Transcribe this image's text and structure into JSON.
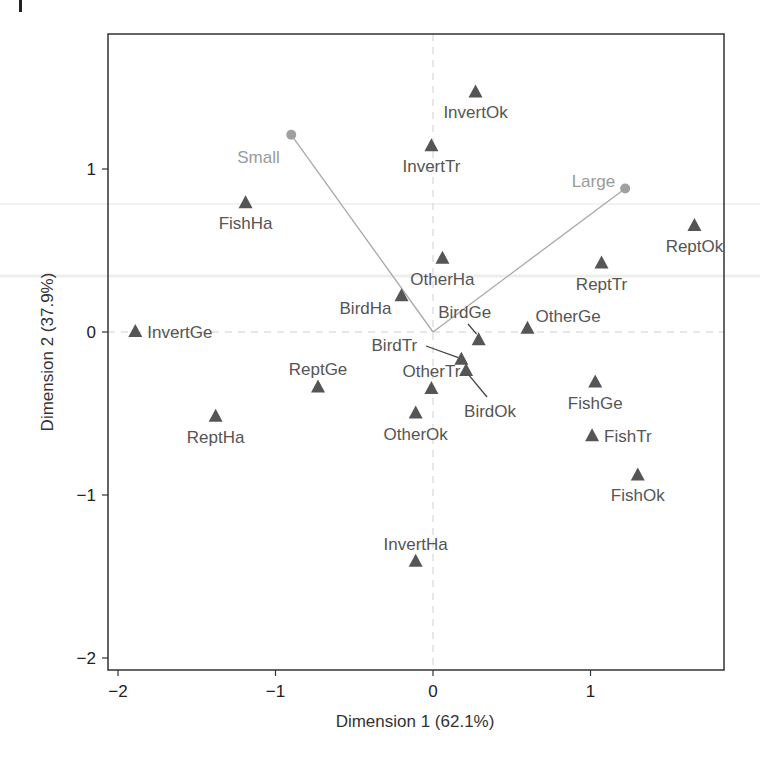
{
  "chart_data": {
    "type": "scatter",
    "title": "",
    "xlabel": "Dimension 1 (62.1%)",
    "ylabel": "Dimension 2 (37.9%)",
    "xlim": [
      -2.07,
      1.85
    ],
    "ylim": [
      -2.07,
      1.83
    ],
    "xticks": [
      -2,
      -1,
      0,
      1
    ],
    "yticks": [
      -2,
      -1,
      0,
      1
    ],
    "xtick_labels": [
      "−2",
      "−1",
      "0",
      "1"
    ],
    "ytick_labels": [
      "−2",
      "−1",
      "0",
      "1"
    ],
    "grid": false,
    "reference_lines": {
      "x": 0,
      "y": 0,
      "style": "dashed",
      "color": "#cfcfcf"
    },
    "legend": null,
    "series": [
      {
        "name": "Rows (animal x habitat)",
        "marker": "triangle",
        "color": "#555555",
        "points": [
          {
            "label": "InvertOk",
            "x": 0.27,
            "y": 1.47,
            "label_pos": "below"
          },
          {
            "label": "InvertTr",
            "x": -0.01,
            "y": 1.14,
            "label_pos": "below"
          },
          {
            "label": "FishHa",
            "x": -1.19,
            "y": 0.79,
            "label_pos": "below"
          },
          {
            "label": "ReptOk",
            "x": 1.66,
            "y": 0.65,
            "label_pos": "below"
          },
          {
            "label": "ReptTr",
            "x": 1.07,
            "y": 0.42,
            "label_pos": "below"
          },
          {
            "label": "OtherHa",
            "x": 0.06,
            "y": 0.45,
            "label_pos": "below"
          },
          {
            "label": "BirdHa",
            "x": -0.2,
            "y": 0.22,
            "label_pos": "below-left"
          },
          {
            "label": "BirdGe",
            "x": 0.29,
            "y": -0.05,
            "label_pos": "above-callout"
          },
          {
            "label": "OtherGe",
            "x": 0.6,
            "y": 0.02,
            "label_pos": "above-right"
          },
          {
            "label": "InvertGe",
            "x": -1.89,
            "y": 0.0,
            "label_pos": "right"
          },
          {
            "label": "BirdTr",
            "x": 0.18,
            "y": -0.17,
            "label_pos": "left-callout"
          },
          {
            "label": "BirdOk",
            "x": 0.21,
            "y": -0.24,
            "label_pos": "below-callout"
          },
          {
            "label": "OtherTr",
            "x": -0.01,
            "y": -0.35,
            "label_pos": "above"
          },
          {
            "label": "ReptGe",
            "x": -0.73,
            "y": -0.34,
            "label_pos": "above"
          },
          {
            "label": "OtherOk",
            "x": -0.11,
            "y": -0.5,
            "label_pos": "below"
          },
          {
            "label": "ReptHa",
            "x": -1.38,
            "y": -0.52,
            "label_pos": "below"
          },
          {
            "label": "FishGe",
            "x": 1.03,
            "y": -0.31,
            "label_pos": "below"
          },
          {
            "label": "FishTr",
            "x": 1.01,
            "y": -0.64,
            "label_pos": "right"
          },
          {
            "label": "FishOk",
            "x": 1.3,
            "y": -0.88,
            "label_pos": "below"
          },
          {
            "label": "InvertHa",
            "x": -0.11,
            "y": -1.41,
            "label_pos": "above"
          }
        ]
      },
      {
        "name": "Columns (size)",
        "marker": "circle",
        "color": "#a0a0a0",
        "vectors_from_origin": true,
        "points": [
          {
            "label": "Small",
            "x": -0.9,
            "y": 1.21
          },
          {
            "label": "Large",
            "x": 1.22,
            "y": 0.88
          }
        ]
      }
    ]
  }
}
